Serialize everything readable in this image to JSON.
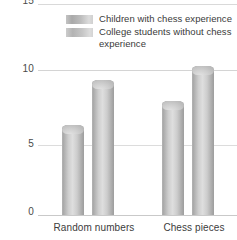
{
  "chart_data": {
    "type": "bar",
    "title": "",
    "subtitle": "",
    "xlabel": "",
    "ylabel": "Number of items recalled",
    "categories": [
      "Random numbers",
      "Chess pieces"
    ],
    "series": [
      {
        "name": "Children with chess experience",
        "values": [
          6,
          7.6
        ],
        "color": "#b9b9b9"
      },
      {
        "name": "College students without chess experience",
        "values": [
          9,
          10
        ],
        "color": "#c9c9c9"
      }
    ],
    "ylim": [
      0,
      15
    ],
    "yticks": [
      "0",
      "5",
      "10",
      "15"
    ],
    "grid": true,
    "grid_color": "#d9d9d9",
    "legend_position": "top-center",
    "style": "3d-cylinder-greyscale"
  },
  "axis": {
    "y_title": "Number of items recalled",
    "ticks": {
      "t15": "15",
      "t10": "10",
      "t5": "5",
      "t0": "0"
    }
  },
  "categories": {
    "first": "Random numbers",
    "second": "Chess pieces"
  },
  "legend": {
    "entries": [
      {
        "label": "Children with chess experience"
      },
      {
        "label": "College students without chess experience"
      }
    ]
  }
}
